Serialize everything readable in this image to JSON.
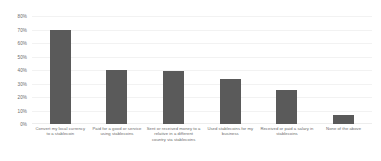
{
  "chart_data": {
    "type": "bar",
    "title": "",
    "subtitle": "",
    "xlabel": "",
    "ylabel": "",
    "ylim": [
      0,
      80
    ],
    "grid": true,
    "legend": false,
    "legend_position": "none",
    "orientation": "vertical",
    "bar_color": "#5a5a5a",
    "gridline_color": "#f2f2f2",
    "tick_label_color": "#6b6b6b",
    "y_ticks": [
      "0%",
      "10%",
      "20%",
      "30%",
      "40%",
      "50%",
      "60%",
      "70%",
      "80%"
    ],
    "y_tick_values": [
      0,
      10,
      20,
      30,
      40,
      50,
      60,
      70,
      80
    ],
    "categories": [
      "Convert my local currency to a stablecoin",
      "Paid for a good or service using stablecoins",
      "Sent or received money to a relative in a different country via stablecoins",
      "Used stablecoins for my business",
      "Received or paid a salary in stablecoins",
      "None of the above"
    ],
    "values": [
      70,
      40,
      39,
      33,
      25,
      7
    ],
    "value_labels": [
      "70%",
      "40%",
      "39%",
      "33%",
      "25%",
      "7%"
    ],
    "show_value_labels": false
  }
}
